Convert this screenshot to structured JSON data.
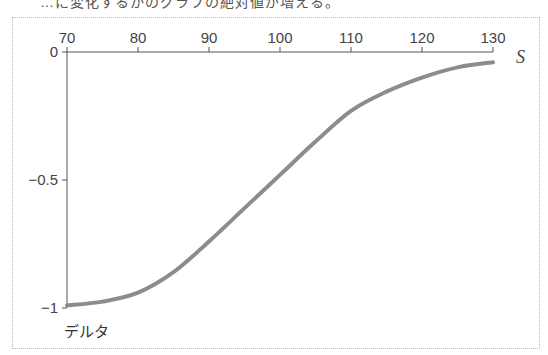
{
  "caption_partial": "…に変化するかのグラフの絶対値が増える。",
  "chart_data": {
    "type": "line",
    "title": "",
    "xlabel": "S",
    "ylabel": "デルタ",
    "x_ticks": [
      70,
      80,
      90,
      100,
      110,
      120,
      130
    ],
    "y_ticks": [
      0,
      -0.5,
      -1
    ],
    "y_tick_labels": [
      "0",
      "−0.5",
      "−1"
    ],
    "xlim": [
      70,
      130
    ],
    "ylim": [
      -1,
      0
    ],
    "grid": false,
    "legend": null,
    "series": [
      {
        "name": "デルタ",
        "color": "#8c8c8c",
        "x": [
          70,
          75,
          80,
          85,
          90,
          95,
          100,
          105,
          110,
          115,
          120,
          125,
          130
        ],
        "values": [
          -0.99,
          -0.975,
          -0.94,
          -0.86,
          -0.74,
          -0.61,
          -0.48,
          -0.35,
          -0.23,
          -0.155,
          -0.1,
          -0.06,
          -0.04
        ]
      }
    ]
  }
}
